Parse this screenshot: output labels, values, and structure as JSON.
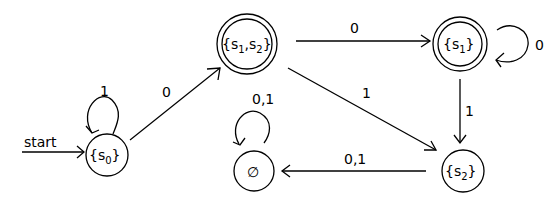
{
  "diagram": {
    "type": "DFA state diagram",
    "start_label": "start",
    "states": [
      {
        "id": "s0",
        "label_main": "{s",
        "label_sub": "0",
        "label_end": "}",
        "accepting": false,
        "start": true
      },
      {
        "id": "s1s2",
        "label_main": "{s",
        "label_sub": "1",
        "label_mid": ",s",
        "label_sub2": "2",
        "label_end": "}",
        "accepting": true
      },
      {
        "id": "s1",
        "label_main": "{s",
        "label_sub": "1",
        "label_end": "}",
        "accepting": true
      },
      {
        "id": "s2",
        "label_main": "{s",
        "label_sub": "2",
        "label_end": "}",
        "accepting": false
      },
      {
        "id": "empty",
        "label": "∅",
        "accepting": false
      }
    ],
    "transitions": [
      {
        "from": "s0",
        "to": "s0",
        "label": "1"
      },
      {
        "from": "s0",
        "to": "s1s2",
        "label": "0"
      },
      {
        "from": "s1s2",
        "to": "s1",
        "label": "0"
      },
      {
        "from": "s1s2",
        "to": "s2",
        "label": "1"
      },
      {
        "from": "s1",
        "to": "s1",
        "label": "0"
      },
      {
        "from": "s1",
        "to": "s2",
        "label": "1"
      },
      {
        "from": "s2",
        "to": "empty",
        "label": "0,1"
      },
      {
        "from": "empty",
        "to": "empty",
        "label": "0,1"
      }
    ]
  }
}
